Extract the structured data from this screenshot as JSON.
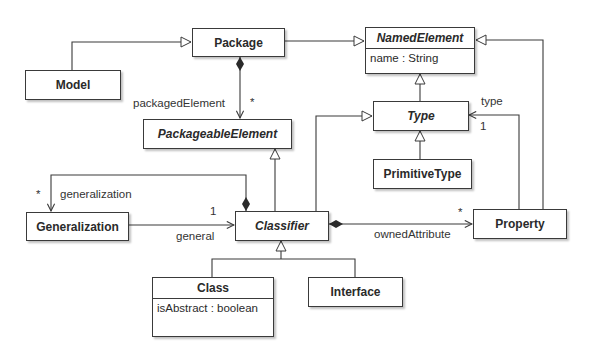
{
  "diagram": {
    "type": "UML class diagram",
    "classes": [
      {
        "id": "package",
        "name": "Package",
        "abstract": false,
        "attributes": []
      },
      {
        "id": "model",
        "name": "Model",
        "abstract": false,
        "attributes": []
      },
      {
        "id": "named-element",
        "name": "NamedElement",
        "abstract": true,
        "attributes": [
          "name : String"
        ]
      },
      {
        "id": "packageable-element",
        "name": "PackageableElement",
        "abstract": true,
        "attributes": []
      },
      {
        "id": "type",
        "name": "Type",
        "abstract": true,
        "attributes": []
      },
      {
        "id": "primitive-type",
        "name": "PrimitiveType",
        "abstract": false,
        "attributes": []
      },
      {
        "id": "generalization",
        "name": "Generalization",
        "abstract": false,
        "attributes": []
      },
      {
        "id": "classifier",
        "name": "Classifier",
        "abstract": true,
        "attributes": []
      },
      {
        "id": "property",
        "name": "Property",
        "abstract": false,
        "attributes": []
      },
      {
        "id": "class",
        "name": "Class",
        "abstract": false,
        "attributes": [
          "isAbstract : boolean"
        ]
      },
      {
        "id": "interface",
        "name": "Interface",
        "abstract": false,
        "attributes": []
      }
    ],
    "relations": [
      {
        "kind": "generalization",
        "from": "Model",
        "to": "Package"
      },
      {
        "kind": "generalization",
        "from": "Package",
        "to": "NamedElement"
      },
      {
        "kind": "generalization",
        "from": "Type",
        "to": "NamedElement"
      },
      {
        "kind": "generalization",
        "from": "Property",
        "to": "NamedElement"
      },
      {
        "kind": "generalization",
        "from": "PrimitiveType",
        "to": "Type"
      },
      {
        "kind": "generalization",
        "from": "Classifier",
        "to": "Type"
      },
      {
        "kind": "generalization",
        "from": "Classifier",
        "to": "PackageableElement"
      },
      {
        "kind": "generalization",
        "from": "Class",
        "to": "Classifier"
      },
      {
        "kind": "generalization",
        "from": "Interface",
        "to": "Classifier"
      },
      {
        "kind": "composition",
        "from": "Package",
        "to": "PackageableElement",
        "role": "packagedElement",
        "multiplicity": "*"
      },
      {
        "kind": "composition",
        "from": "Classifier",
        "to": "Generalization",
        "role": "generalization",
        "multiplicity": "*"
      },
      {
        "kind": "association",
        "from": "Generalization",
        "to": "Classifier",
        "role": "general",
        "multiplicity": "1"
      },
      {
        "kind": "composition",
        "from": "Classifier",
        "to": "Property",
        "role": "ownedAttribute",
        "multiplicity": "*"
      },
      {
        "kind": "association",
        "from": "Property",
        "to": "Type",
        "role": "type",
        "multiplicity": "1"
      }
    ]
  },
  "boxes": {
    "package": {
      "name": "Package"
    },
    "model": {
      "name": "Model"
    },
    "named_element": {
      "name": "NamedElement",
      "attr": "name : String"
    },
    "packageable_element": {
      "name": "PackageableElement"
    },
    "type": {
      "name": "Type"
    },
    "primitive_type": {
      "name": "PrimitiveType"
    },
    "generalization": {
      "name": "Generalization"
    },
    "classifier": {
      "name": "Classifier"
    },
    "property": {
      "name": "Property"
    },
    "class": {
      "name": "Class",
      "attr": "isAbstract : boolean"
    },
    "interface": {
      "name": "Interface"
    }
  },
  "labels": {
    "packaged_element_role": "packagedElement",
    "packaged_element_mult": "*",
    "generalization_role": "generalization",
    "generalization_mult": "*",
    "general_role": "general",
    "general_mult": "1",
    "owned_attribute_role": "ownedAttribute",
    "owned_attribute_mult": "*",
    "type_role": "type",
    "type_mult": "1"
  }
}
